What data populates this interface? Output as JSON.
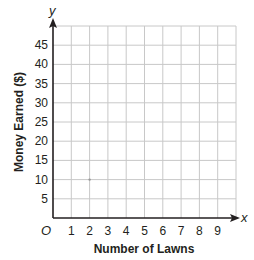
{
  "chart_data": {
    "type": "scatter",
    "title": "",
    "xlabel": "Number of Lawns",
    "ylabel": "Money Earned ($)",
    "x_var": "x",
    "y_var": "y",
    "origin_label": "O",
    "x_ticks": [
      "1",
      "2",
      "3",
      "4",
      "5",
      "6",
      "7",
      "8",
      "9"
    ],
    "y_ticks": [
      "5",
      "10",
      "15",
      "20",
      "25",
      "30",
      "35",
      "40",
      "45"
    ],
    "xlim": [
      0,
      10
    ],
    "ylim": [
      0,
      50
    ],
    "grid": true,
    "points": [
      {
        "x": 2,
        "y": 10,
        "faint": true
      }
    ]
  },
  "colors": {
    "axis": "#231f20",
    "grid": "#c8c8c8",
    "text": "#231f20"
  }
}
